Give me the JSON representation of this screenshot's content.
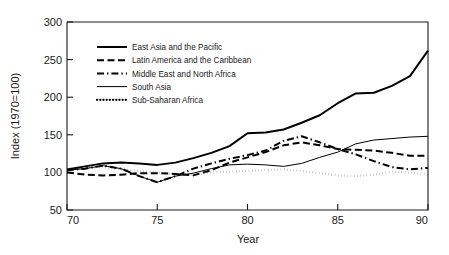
{
  "chart_data": {
    "type": "line",
    "title": "",
    "xlabel": "Year",
    "ylabel": "Index (1970=100)",
    "xlim": [
      70,
      90
    ],
    "ylim": [
      50,
      300
    ],
    "xticks": [
      70,
      75,
      80,
      85,
      90
    ],
    "yticks": [
      50,
      100,
      150,
      200,
      250,
      300
    ],
    "xtick_labels": [
      "70",
      "75",
      "80",
      "85",
      "90"
    ],
    "ytick_labels": [
      "50",
      "100",
      "150",
      "200",
      "250",
      "300"
    ],
    "grid": false,
    "legend_position": "upper-left-inside",
    "x": [
      70,
      71,
      72,
      73,
      74,
      75,
      76,
      77,
      78,
      79,
      80,
      81,
      82,
      83,
      84,
      85,
      86,
      87,
      88,
      89,
      90
    ],
    "series": [
      {
        "name": "East Asia and the Pacific",
        "style": "solid",
        "color": "#000000",
        "width": 2.0,
        "values": [
          104,
          108,
          112,
          113,
          112,
          110,
          113,
          119,
          126,
          135,
          152,
          153,
          157,
          166,
          176,
          192,
          205,
          206,
          215,
          228,
          262
        ]
      },
      {
        "name": "Latin America and the Caribbean",
        "style": "dashed",
        "color": "#000000",
        "width": 2.0,
        "values": [
          100,
          97,
          96,
          97,
          99,
          99,
          98,
          96,
          103,
          113,
          120,
          127,
          136,
          140,
          136,
          131,
          130,
          129,
          126,
          122,
          122
        ]
      },
      {
        "name": "Middle East and North Africa",
        "style": "dashdot",
        "color": "#000000",
        "width": 2.0,
        "values": [
          103,
          105,
          109,
          105,
          95,
          87,
          95,
          105,
          112,
          118,
          123,
          129,
          142,
          148,
          140,
          131,
          124,
          115,
          107,
          104,
          106
        ]
      },
      {
        "name": "South Asia",
        "style": "solid",
        "color": "#000000",
        "width": 1.0,
        "values": [
          103,
          105,
          109,
          105,
          95,
          87,
          95,
          99,
          105,
          110,
          111,
          110,
          108,
          112,
          120,
          127,
          138,
          143,
          145,
          147,
          148
        ]
      },
      {
        "name": "Sub-Saharan Africa",
        "style": "dotted",
        "color": "#000000",
        "width": 2.2,
        "values": [
          105,
          106,
          107,
          104,
          102,
          100,
          98,
          97,
          100,
          101,
          102,
          103,
          104,
          102,
          99,
          96,
          95,
          97,
          101,
          100,
          97
        ]
      }
    ]
  },
  "legend": {
    "entries": [
      {
        "label": "East Asia and the Pacific"
      },
      {
        "label": "Latin America and the Caribbean"
      },
      {
        "label": "Middle East and North Africa"
      },
      {
        "label": "South Asia"
      },
      {
        "label": "Sub-Saharan Africa"
      }
    ]
  }
}
